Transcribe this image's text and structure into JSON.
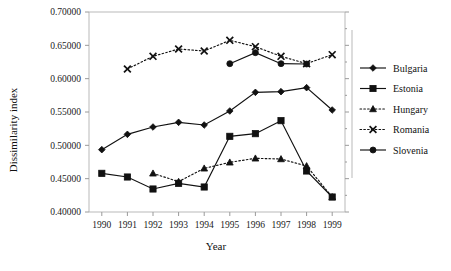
{
  "chart_data": {
    "type": "line",
    "title": "",
    "xlabel": "Year",
    "ylabel": "Dissimilarity index",
    "x": [
      1990,
      1991,
      1992,
      1993,
      1994,
      1995,
      1996,
      1997,
      1998,
      1999
    ],
    "categories": [
      "1990",
      "1991",
      "1992",
      "1993",
      "1994",
      "1995",
      "1996",
      "1997",
      "1998",
      "1999"
    ],
    "xlim": [
      1989.5,
      1999.5
    ],
    "ylim": [
      0.4,
      0.7
    ],
    "ytick_labels": [
      "0.70000",
      "0.65000",
      "0.60000",
      "0.55000",
      "0.50000",
      "0.45000",
      "0.40000"
    ],
    "ytick_values": [
      0.7,
      0.65,
      0.6,
      0.55,
      0.5,
      0.45,
      0.4
    ],
    "grid": false,
    "legend_position": "right",
    "series": [
      {
        "name": "Bulgaria",
        "marker": "diamond",
        "linestyle": "solid",
        "color": "#111111",
        "x": [
          1990,
          1991,
          1992,
          1993,
          1994,
          1995,
          1996,
          1997,
          1998,
          1999
        ],
        "values": [
          0.4935,
          0.5165,
          0.5275,
          0.5345,
          0.5305,
          0.5515,
          0.5795,
          0.5805,
          0.5865,
          0.553
        ]
      },
      {
        "name": "Estonia",
        "marker": "square",
        "linestyle": "solid",
        "color": "#111111",
        "x": [
          1990,
          1991,
          1992,
          1993,
          1994,
          1995,
          1996,
          1997,
          1998,
          1999
        ],
        "values": [
          0.458,
          0.4525,
          0.4345,
          0.443,
          0.4375,
          0.5135,
          0.5175,
          0.537,
          0.4615,
          0.4225
        ]
      },
      {
        "name": "Hungary",
        "marker": "triangle",
        "linestyle": "dotted",
        "color": "#111111",
        "x": [
          1992,
          1993,
          1994,
          1995,
          1996,
          1997,
          1998,
          1999
        ],
        "values": [
          0.458,
          0.4455,
          0.4655,
          0.4745,
          0.4805,
          0.4795,
          0.469,
          0.4225
        ]
      },
      {
        "name": "Romania",
        "marker": "x",
        "linestyle": "dotted",
        "color": "#111111",
        "x": [
          1991,
          1992,
          1993,
          1994,
          1995,
          1996,
          1997,
          1998,
          1999
        ],
        "values": [
          0.6145,
          0.6335,
          0.6445,
          0.6415,
          0.6575,
          0.648,
          0.6335,
          0.6225,
          0.636
        ]
      },
      {
        "name": "Slovenia",
        "marker": "circle",
        "linestyle": "solid",
        "color": "#111111",
        "x": [
          1995,
          1996,
          1997,
          1998
        ],
        "values": [
          0.6225,
          0.639,
          0.6225,
          0.622
        ]
      }
    ]
  },
  "axes": {
    "y_title": "Dissimilarity index",
    "x_title": "Year"
  },
  "legend": {
    "entries": [
      {
        "label": "Bulgaria",
        "marker": "diamond",
        "linestyle": "solid"
      },
      {
        "label": "Estonia",
        "marker": "square",
        "linestyle": "solid"
      },
      {
        "label": "Hungary",
        "marker": "triangle",
        "linestyle": "dotted"
      },
      {
        "label": "Romania",
        "marker": "x",
        "linestyle": "dotted"
      },
      {
        "label": "Slovenia",
        "marker": "circle",
        "linestyle": "solid"
      }
    ]
  }
}
